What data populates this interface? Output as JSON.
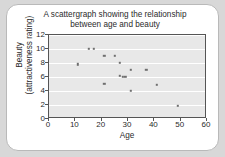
{
  "chart_data": {
    "type": "scatter",
    "title": "A scattergraph showing the relationship\nbetween age and beauty",
    "xlabel": "Age",
    "ylabel": "Beauty\n(attractiveness rating)",
    "xlim": [
      0,
      60
    ],
    "ylim": [
      0,
      12
    ],
    "xticks": [
      0,
      10,
      20,
      30,
      40,
      50,
      60
    ],
    "yticks": [
      0,
      2,
      4,
      6,
      8,
      10,
      12
    ],
    "grid": "horizontal",
    "legend": "none",
    "point_color": "#6f6f6f",
    "plot_background": "#e8e8e8",
    "series": [
      {
        "name": "age vs beauty",
        "points": [
          {
            "x": 11,
            "y": 7.8
          },
          {
            "x": 15,
            "y": 10
          },
          {
            "x": 17,
            "y": 10
          },
          {
            "x": 21,
            "y": 9
          },
          {
            "x": 21,
            "y": 5
          },
          {
            "x": 25,
            "y": 9
          },
          {
            "x": 27,
            "y": 8
          },
          {
            "x": 27,
            "y": 6.2
          },
          {
            "x": 28,
            "y": 6
          },
          {
            "x": 29,
            "y": 6
          },
          {
            "x": 31,
            "y": 7
          },
          {
            "x": 31,
            "y": 4
          },
          {
            "x": 37,
            "y": 7
          },
          {
            "x": 41,
            "y": 4.9
          },
          {
            "x": 49,
            "y": 1.9
          }
        ]
      }
    ]
  }
}
